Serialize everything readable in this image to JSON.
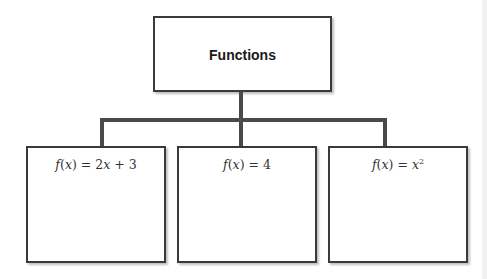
{
  "diagram": {
    "type": "tree",
    "root": {
      "label": "Functions"
    },
    "children": [
      {
        "fname": "f",
        "var": "x",
        "eq": "=",
        "expr_coef": "2",
        "expr_var": "x",
        "expr_rest": " + 3",
        "label": "f(x) = 2x + 3"
      },
      {
        "fname": "f",
        "var": "x",
        "eq": "=",
        "expr_const": "4",
        "label": "f(x) = 4"
      },
      {
        "fname": "f",
        "var": "x",
        "eq": "=",
        "expr_var": "x",
        "exponent": "2",
        "label": "f(x) = x^2"
      }
    ]
  },
  "colors": {
    "border": "#3a3a3a",
    "connector": "#4a4a4a",
    "text": "#333333"
  }
}
